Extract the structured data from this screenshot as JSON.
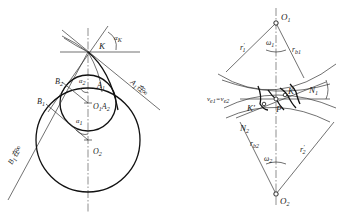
{
  "figure": {
    "left": {
      "description": "Conjugate profile curvature diagram with two circles centered on vertical axis",
      "labels": {
        "K": "K",
        "alpha_K": "α",
        "alpha_K_sub": "K",
        "B2": "B",
        "B2_sub": "2",
        "B1": "B",
        "B1_sub": "1",
        "A1": "A",
        "A1_sub": "1",
        "alpha_2": "α",
        "alpha_2_sub": "2",
        "alpha_1": "α",
        "alpha_1_sub": "1",
        "O1A2": "O",
        "O1A2_sub1": "1",
        "O1A2_mid": "A",
        "O1A2_sub2": "2",
        "O2": "O",
        "O2_sub": "2",
        "A1_inf": "A",
        "A1_inf_sub": "1",
        "A1_inf_text": "在∞",
        "B1_inf": "B",
        "B1_inf_sub": "1",
        "B1_inf_text": "在∞"
      }
    },
    "right": {
      "description": "Gear meshing diagram with pitch point and line of action",
      "labels": {
        "O1": "O",
        "O1_sub": "1",
        "r1p": "r",
        "r1p_sub": "1",
        "r1p_sup": "′",
        "omega1": "ω",
        "omega1_sub": "1",
        "rb1": "r",
        "rb1_sub": "b1",
        "N1": "N",
        "N1_sub": "1",
        "K": "K",
        "Kp": "K′",
        "P": "P",
        "velocity": "v",
        "velocity_sub1": "e1",
        "velocity_eq": "=v",
        "velocity_sub2": "e2",
        "N2": "N",
        "N2_sub": "2",
        "rb2": "r",
        "rb2_sub": "b2",
        "omega2": "ω",
        "omega2_sub": "2",
        "r2p": "r",
        "r2p_sub": "2",
        "r2p_sup": "′",
        "O2": "O",
        "O2_sub": "2"
      }
    }
  }
}
